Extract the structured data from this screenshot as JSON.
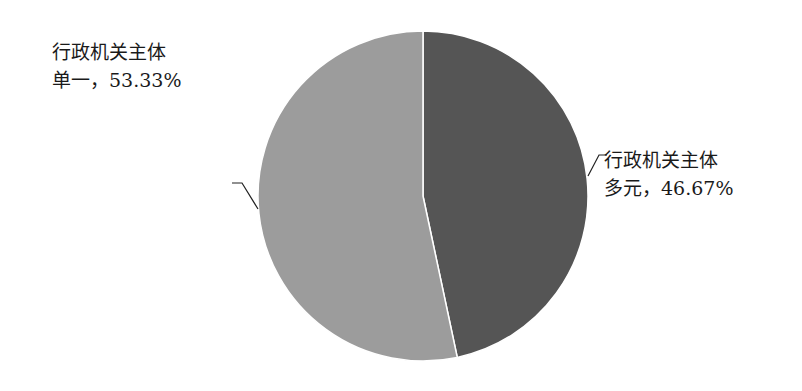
{
  "chart_data": {
    "type": "pie",
    "title": "",
    "start": "top",
    "direction": "clockwise",
    "slices": [
      {
        "name": "行政机关主体多元",
        "line1": "行政机关主体",
        "line2": "多元，46.67%",
        "value": 46.67,
        "color": "#555555"
      },
      {
        "name": "行政机关主体单一",
        "line1": "行政机关主体",
        "line2": "单一，53.33%",
        "value": 53.33,
        "color": "#9c9c9c"
      }
    ]
  }
}
